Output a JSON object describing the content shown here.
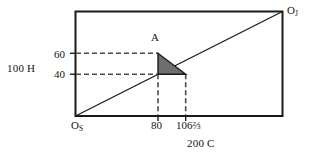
{
  "figure": {
    "title": "",
    "axes": {
      "y_axis_label": "100 H",
      "x_axis_label": "200 C",
      "y_ticks": [
        {
          "value": 60,
          "label": "60"
        },
        {
          "value": 40,
          "label": "40"
        }
      ],
      "x_ticks": [
        {
          "value": 80,
          "label": "80"
        },
        {
          "value": 106.6667,
          "label": "106⅔"
        }
      ],
      "origin_label": "O",
      "origin_subscript": "S",
      "corner_label": "O",
      "corner_subscript": "J"
    },
    "points": [
      {
        "name": "A",
        "label": "A",
        "x": 80,
        "y": 60
      }
    ],
    "shapes": {
      "triangle_vertices": [
        {
          "x": 80,
          "y": 60
        },
        {
          "x": 80,
          "y": 40
        },
        {
          "x": 106.6667,
          "y": 40
        }
      ],
      "triangle_fill": "#6e6e6e",
      "diagonal_from": {
        "x": 0,
        "y": 0
      },
      "diagonal_to": {
        "x": 200,
        "y": 100
      }
    },
    "colors": {
      "frame": "#1a1a1a",
      "dashed": "#4a4a4a",
      "solid_line": "#1a1a1a",
      "triangle_fill": "#6e6e6e",
      "background": "#ffffff",
      "text": "#141414"
    }
  }
}
